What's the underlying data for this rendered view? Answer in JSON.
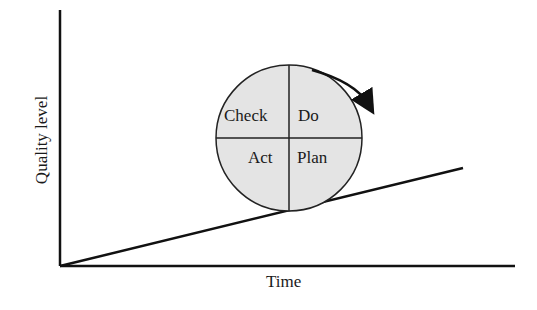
{
  "diagram": {
    "type": "PDCA continuous improvement wheel on incline",
    "axes": {
      "y_label": "Quality level",
      "x_label": "Time"
    },
    "wheel": {
      "quadrants": {
        "top_left": "Check",
        "top_right": "Do",
        "bottom_left": "Act",
        "bottom_right": "Plan"
      },
      "fill_color": "#e4e4e4",
      "rotation_direction": "clockwise"
    },
    "incline_line": {
      "from": [
        60,
        266
      ],
      "to": [
        463,
        168
      ]
    },
    "colors": {
      "stroke": "#111111",
      "background": "#ffffff"
    }
  }
}
